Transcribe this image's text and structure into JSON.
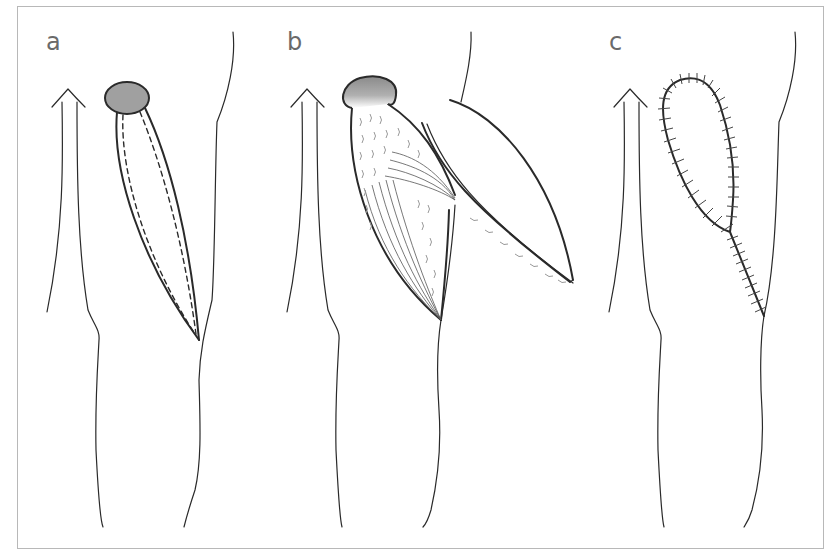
{
  "figure": {
    "panels": [
      {
        "label": "a",
        "description": "Flap outlined with dashed incision lines from gray defect to distal apex"
      },
      {
        "label": "b",
        "description": "Flap raised and transposed showing undersurface and fan-shaped vessels"
      },
      {
        "label": "c",
        "description": "Flap sutured in place with interrupted sutures along closure line"
      }
    ],
    "colors": {
      "line": "#2a2a2a",
      "defect_fill": "#a0a0a0",
      "label": "#6a6a6a",
      "frame": "#b8b8b8"
    },
    "icons": {
      "arrow": "upward-open-arrow"
    }
  }
}
